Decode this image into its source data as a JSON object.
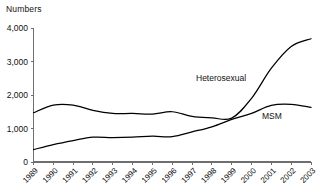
{
  "chart_data": {
    "type": "line",
    "title": "",
    "ylabel": "Numbers",
    "xlabel": "",
    "ylim": [
      0,
      4000
    ],
    "yticks": [
      0,
      1000,
      2000,
      3000,
      4000
    ],
    "ytick_labels": [
      "0",
      "1,000",
      "2,000",
      "3,000",
      "4,000"
    ],
    "grid": false,
    "legend_position": "inline-annotation",
    "categories": [
      "1989",
      "1990",
      "1991",
      "1992",
      "1993",
      "1994",
      "1995",
      "1996",
      "1997",
      "1998",
      "1999",
      "2000",
      "2001",
      "2002",
      "2003"
    ],
    "series": [
      {
        "name": "Heterosexual",
        "label": "Heterosexual",
        "color": "#000000",
        "values": [
          1470,
          1700,
          1700,
          1540,
          1450,
          1450,
          1430,
          1500,
          1360,
          1320,
          1310,
          1900,
          2800,
          3450,
          3680
        ]
      },
      {
        "name": "MSM",
        "label": "MSM",
        "color": "#000000",
        "values": [
          370,
          520,
          640,
          740,
          730,
          740,
          770,
          760,
          900,
          1050,
          1270,
          1450,
          1690,
          1720,
          1630
        ]
      }
    ],
    "annotations": [
      {
        "text": "Heterosexual",
        "series": "Heterosexual"
      },
      {
        "text": "MSM",
        "series": "MSM"
      }
    ]
  },
  "axis": {
    "y_title": "Numbers"
  }
}
